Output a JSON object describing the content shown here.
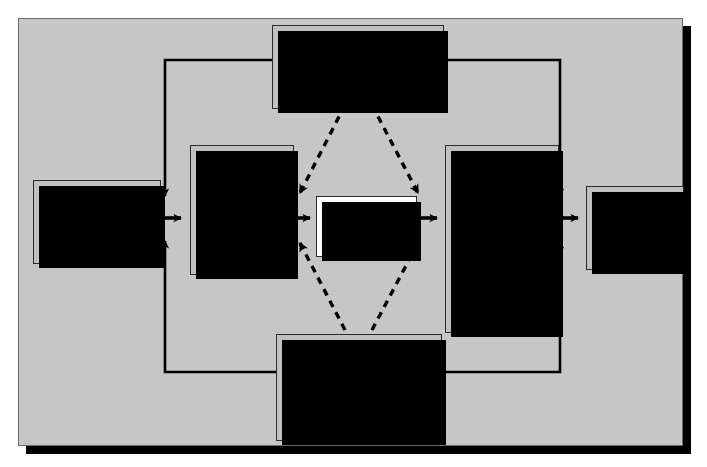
{
  "diagram": {
    "background_color": "#c6c6c6",
    "node_fill": "#c0c0c0",
    "node_fill_highlight": "#fdfdfd",
    "line_color": "#000000"
  },
  "nodes": {
    "antecedents": {
      "title": "Antecedents to stress",
      "items": [
        "Stress markers",
        "Family background",
        "Neighborhood",
        "Cultural expectations",
        "Home relationships"
      ]
    },
    "life_stressors": {
      "title": "Life stressors",
      "group1_label": "Physical",
      "group1_items": [
        "Noise",
        "Light",
        "Vibration"
      ],
      "group2_label": "Psychosocial",
      "group2_items": [
        "Role ambiguity",
        "Role conflict",
        "Role overload",
        "Personal conflict"
      ]
    },
    "personal_qualities": {
      "title": "Personal qualities that influence stress",
      "items": [
        "Personality type",
        "Self-esteem",
        "Locus of control",
        "Demographic characteristics"
      ]
    },
    "perception": {
      "title": "Perception of events",
      "items": [
        "Thoughts about\nevents"
      ]
    },
    "responses": {
      "title": "Responses to stress",
      "group1_label": "Physiological",
      "group1_items": [
        "Cardiovascular",
        "Biochemical",
        "Gastrointestinal",
        "Musculoskeletal"
      ],
      "group2_label": "Psychological",
      "group2_items": [
        "Depression",
        "Anxiety",
        "Job dissatisfaction",
        "Anger"
      ],
      "group3_label": "Behavioral",
      "group3_items": [
        "Inability to work",
        "Inefficiency",
        "Arguments"
      ]
    },
    "consequences": {
      "title": "Consequences\nof stress",
      "items": [
        "Health/illness",
        "Personal/work\neffectiveness",
        "Social interaction"
      ]
    },
    "mediators": {
      "title": "Factors that act as stress mediators",
      "items": [
        "Family support",
        "Social support",
        "Work support",
        "Faith/religion",
        "Personal time",
        "Exercise/health habits"
      ]
    }
  }
}
